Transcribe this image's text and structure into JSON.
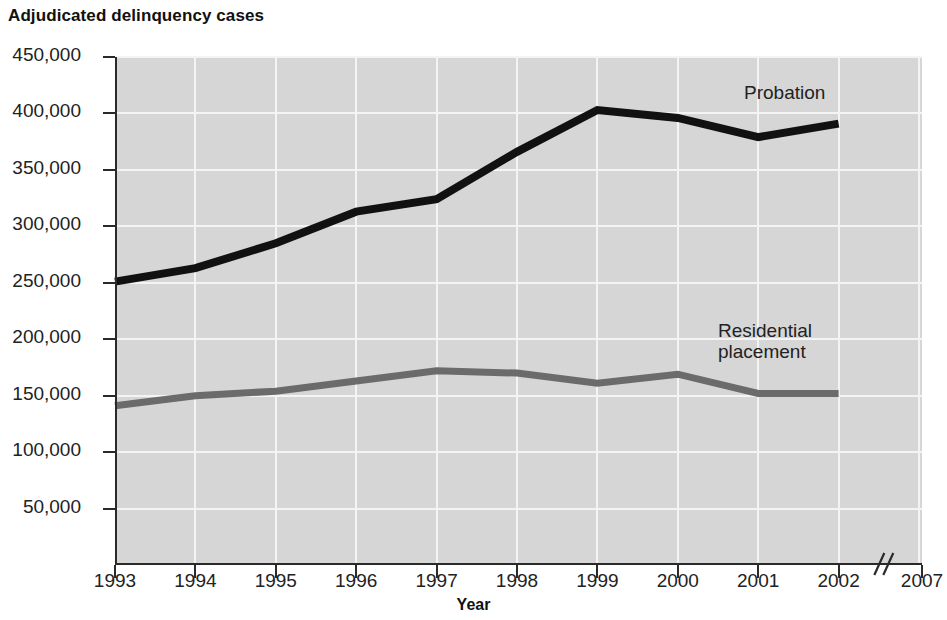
{
  "chart_data": {
    "type": "line",
    "title": "Adjudicated delinquency cases",
    "xlabel": "Year",
    "ylabel": "",
    "categories": [
      "1993",
      "1994",
      "1995",
      "1996",
      "1997",
      "1998",
      "1999",
      "2000",
      "2001",
      "2002"
    ],
    "x_tick_labels": [
      "1993",
      "1994",
      "1995",
      "1996",
      "1997",
      "1998",
      "1999",
      "2000",
      "2001",
      "2002",
      "2007"
    ],
    "y_tick_labels": [
      "450,000",
      "400,000",
      "350,000",
      "300,000",
      "250,000",
      "200,000",
      "150,000",
      "100,000",
      "50,000"
    ],
    "y_tick_values": [
      450000,
      400000,
      350000,
      300000,
      250000,
      200000,
      150000,
      100000,
      50000
    ],
    "ylim": [
      0,
      450000
    ],
    "grid": true,
    "legend_position": "inline-annotation",
    "axis_break": {
      "present": true,
      "symbol": "//",
      "between": [
        "2002",
        "2007"
      ]
    },
    "series": [
      {
        "name": "Probation",
        "color": "#111111",
        "values": [
          251000,
          263000,
          285000,
          313000,
          324000,
          366000,
          403000,
          396000,
          379000,
          391000
        ]
      },
      {
        "name": "Residential placement",
        "color": "#6b6b6b",
        "values": [
          141000,
          150000,
          154000,
          163000,
          172000,
          170000,
          161000,
          169000,
          152000,
          152000
        ]
      }
    ],
    "annotations": [
      {
        "text": "Probation",
        "series": "Probation"
      },
      {
        "text": "Residential\nplacement",
        "series": "Residential placement"
      }
    ]
  },
  "style": {
    "plot_background": "#d6d6d6",
    "gridline_color": "#f4f4f4",
    "axis_color": "#2a2a2a",
    "page_background": "#ffffff"
  }
}
